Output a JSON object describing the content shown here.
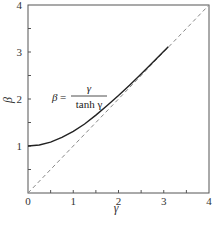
{
  "chart_data": {
    "type": "line",
    "title": "",
    "xlabel": "γ",
    "ylabel": "β",
    "xlim": [
      0,
      4
    ],
    "ylim": [
      0,
      4
    ],
    "grid": false,
    "x_ticks": [
      "0",
      "1",
      "2",
      "3",
      "4"
    ],
    "y_ticks": [
      "1",
      "2",
      "3",
      "4"
    ],
    "annotation": {
      "lhs": "β",
      "eq": "=",
      "numerator": "γ",
      "denominator": "tanh γ"
    },
    "series": [
      {
        "name": "β = γ / tanh γ",
        "style": "solid",
        "x": [
          0,
          0.25,
          0.5,
          0.75,
          1.0,
          1.25,
          1.5,
          1.75,
          2.0,
          2.25,
          2.5,
          2.75,
          3.0,
          3.1
        ],
        "values": [
          1.0,
          1.021,
          1.082,
          1.182,
          1.313,
          1.469,
          1.658,
          1.862,
          2.075,
          2.299,
          2.533,
          2.773,
          3.015,
          3.113
        ]
      },
      {
        "name": "β = γ (asymptote)",
        "style": "dashed",
        "x": [
          0,
          4
        ],
        "values": [
          0,
          4
        ]
      }
    ]
  }
}
